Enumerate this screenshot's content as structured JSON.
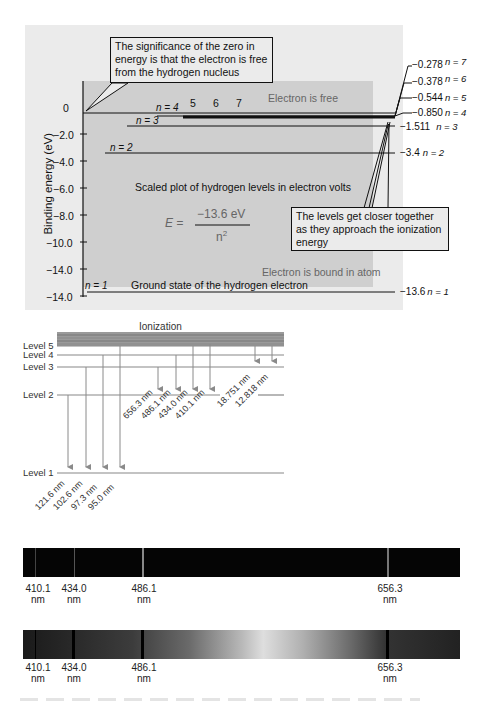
{
  "energy_diagram": {
    "ylabel": "Binding energy (eV)",
    "yticks": [
      "0",
      "−2.0",
      "−4.0",
      "−6.0",
      "−8.0",
      "−10.0",
      "−14.0",
      "−14.0"
    ],
    "callout_zero": "The significance of the zero in energy is that the electron is free from the hydrogen nucleus",
    "callout_levels": "The levels get closer together as they approach the ionization energy",
    "region_free": "Electron is free",
    "region_bound": "Electron is bound in atom",
    "scaled_plot_label": "Scaled plot of hydrogen levels in electron volts",
    "formula": {
      "lhs": "E =",
      "numerator": "−13.6 eV",
      "denominator": "n",
      "exponent": "2"
    },
    "ground_state_label": "Ground state of the hydrogen electron",
    "inner_labels": {
      "n4": "n = 4",
      "n3": "n = 3",
      "n2": "n = 2",
      "n1": "n = 1",
      "five": "5",
      "six": "6",
      "seven": "7"
    },
    "levels": [
      {
        "n": 7,
        "energy": "−0.278",
        "label": "n = 7"
      },
      {
        "n": 6,
        "energy": "−0.378",
        "label": "n = 6"
      },
      {
        "n": 5,
        "energy": "−0.544",
        "label": "n = 5"
      },
      {
        "n": 4,
        "energy": "−0.850",
        "label": "n = 4"
      },
      {
        "n": 3,
        "energy": "−1.511",
        "label": "n = 3"
      },
      {
        "n": 2,
        "energy": "−3.4",
        "label": "n = 2"
      },
      {
        "n": 1,
        "energy": "−13.6",
        "label": "n = 1"
      }
    ]
  },
  "transition_diagram": {
    "ionization_label": "Ionization",
    "level_labels": [
      "Level 5",
      "Level 4",
      "Level 3",
      "Level 2",
      "Level 1"
    ],
    "balmer": [
      "656.3 nm",
      "486.1 nm",
      "434.0 nm",
      "410.1 nm"
    ],
    "paschen": [
      "18.751 nm",
      "12.818 nm"
    ],
    "lyman": [
      "121.6 nm",
      "102.6 nm",
      "97.3 nm",
      "95.0 nm"
    ]
  },
  "emission_spectrum": {
    "lines": [
      {
        "wavelength": "410.1",
        "unit": "nm"
      },
      {
        "wavelength": "434.0",
        "unit": "nm"
      },
      {
        "wavelength": "486.1",
        "unit": "nm"
      },
      {
        "wavelength": "656.3",
        "unit": "nm"
      }
    ]
  },
  "absorption_spectrum": {
    "lines": [
      {
        "wavelength": "410.1",
        "unit": "nm"
      },
      {
        "wavelength": "434.0",
        "unit": "nm"
      },
      {
        "wavelength": "486.1",
        "unit": "nm"
      },
      {
        "wavelength": "656.3",
        "unit": "nm"
      }
    ]
  }
}
